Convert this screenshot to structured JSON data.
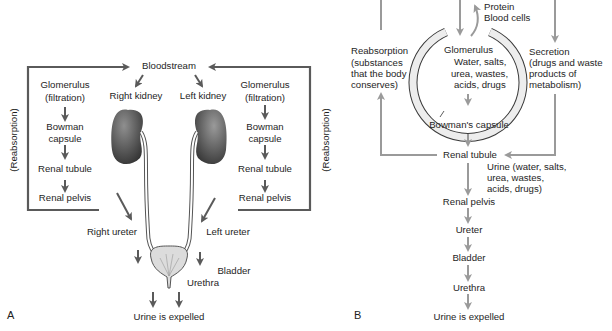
{
  "panel_a": {
    "letter": "A",
    "bloodstream": "Bloodstream",
    "right_kidney": "Right kidney",
    "left_kidney": "Left kidney",
    "left_chain": {
      "glomerulus": "Glomerulus",
      "filtration": "(filtration)",
      "bowman_1": "Bowman",
      "bowman_2": "capsule",
      "renal_tubule": "Renal tubule",
      "renal_pelvis": "Renal pelvis"
    },
    "right_chain": {
      "glomerulus": "Glomerulus",
      "filtration": "(filtration)",
      "bowman_1": "Bowman",
      "bowman_2": "capsule",
      "renal_tubule": "Renal tubule",
      "renal_pelvis": "Renal pelvis"
    },
    "reabsorption_left": "(Reabsorption)",
    "reabsorption_right": "(Reabsorption)",
    "right_ureter": "Right ureter",
    "left_ureter": "Left ureter",
    "bladder": "Bladder",
    "urethra": "Urethra",
    "expelled": "Urine is expelled"
  },
  "panel_b": {
    "letter": "B",
    "protein": "Protein",
    "blood_cells": "Blood cells",
    "reabsorption_lines": [
      "Reabsorption",
      "(substances",
      "that the body",
      "conserves)"
    ],
    "glomerulus": "Glomerulus",
    "glom_contents": [
      "Water, salts,",
      "urea, wastes,",
      "acids, drugs"
    ],
    "secretion_lines": [
      "Secretion",
      "(drugs and waste",
      "products of",
      "metabolism)"
    ],
    "bowmans_capsule": "Bowman's capsule",
    "renal_tubule": "Renal tubule",
    "urine_lines": [
      "Urine (water, salts,",
      "urea, wastes,",
      "acids, drugs)"
    ],
    "renal_pelvis": "Renal pelvis",
    "ureter": "Ureter",
    "bladder": "Bladder",
    "urethra": "Urethra",
    "expelled": "Urine is expelled"
  },
  "colors": {
    "panel_a_lines": "#5a5a5a",
    "panel_b_lines": "#9a9a9a",
    "kidney_dark": "#3d3d3d",
    "kidney_light": "#8a8a8a",
    "bladder_fill": "#dcdcdc"
  }
}
